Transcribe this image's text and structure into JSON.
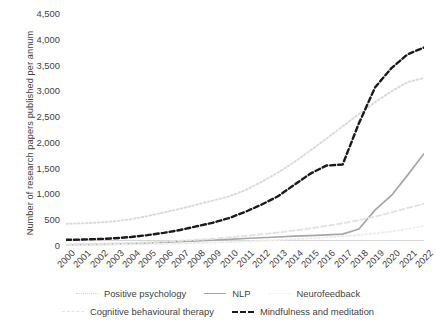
{
  "chart_data": {
    "type": "line",
    "title": "",
    "xlabel": "",
    "ylabel": "Number of research papers published per annum",
    "ylim": [
      0,
      4500
    ],
    "ytick_step": 500,
    "grid": false,
    "legend_position": "bottom",
    "categories": [
      "2000",
      "2001",
      "2002",
      "2003",
      "2004",
      "2005",
      "2006",
      "2007",
      "2008",
      "2009",
      "2010",
      "2011",
      "2012",
      "2013",
      "2014",
      "2015",
      "2016",
      "2017",
      "2018",
      "2019",
      "2020",
      "2021",
      "2022"
    ],
    "yticks": [
      "0",
      "500",
      "1,000",
      "1,500",
      "2,000",
      "2,500",
      "3,000",
      "3,500",
      "4,000",
      "4,500"
    ],
    "series": [
      {
        "name": "Positive psychology",
        "color": "#d9d9d9",
        "style": "dotted",
        "values": [
          430,
          440,
          455,
          480,
          520,
          580,
          650,
          720,
          800,
          880,
          960,
          1080,
          1240,
          1420,
          1620,
          1850,
          2080,
          2320,
          2560,
          2790,
          3000,
          3180,
          3260
        ]
      },
      {
        "name": "NLP",
        "color": "#a6a6a6",
        "style": "solid",
        "values": [
          20,
          25,
          30,
          35,
          45,
          55,
          70,
          85,
          100,
          115,
          130,
          145,
          160,
          175,
          190,
          200,
          215,
          230,
          330,
          700,
          980,
          1380,
          1790
        ]
      },
      {
        "name": "Neurofeedback",
        "color": "#ededed",
        "style": "dotted",
        "values": [
          15,
          18,
          22,
          26,
          30,
          36,
          42,
          50,
          58,
          66,
          76,
          88,
          100,
          115,
          130,
          148,
          168,
          190,
          215,
          245,
          280,
          330,
          390
        ]
      },
      {
        "name": "Cognitive behavioural therapy",
        "color": "#e2e2e2",
        "style": "dashed",
        "values": [
          30,
          35,
          42,
          50,
          60,
          72,
          86,
          102,
          120,
          140,
          165,
          195,
          225,
          260,
          300,
          340,
          390,
          440,
          500,
          570,
          650,
          740,
          820
        ]
      },
      {
        "name": "Mindfulness and meditation",
        "color": "#1a1a1a",
        "style": "dashed",
        "values": [
          120,
          125,
          135,
          150,
          175,
          210,
          255,
          310,
          380,
          450,
          540,
          660,
          800,
          960,
          1180,
          1400,
          1560,
          1580,
          2380,
          3080,
          3450,
          3720,
          3850
        ]
      }
    ]
  },
  "legend": {
    "row1": [
      "Positive psychology",
      "NLP",
      "Neurofeedback"
    ],
    "row2": [
      "Cognitive behavioural therapy",
      "Mindfulness and meditation"
    ]
  }
}
